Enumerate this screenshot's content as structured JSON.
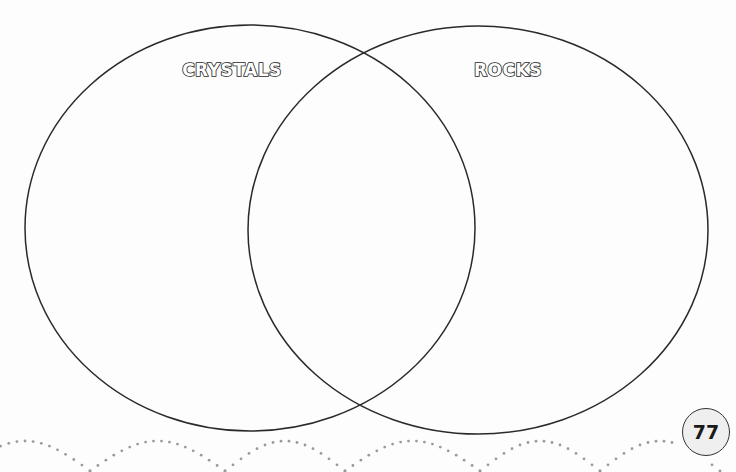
{
  "diagram": {
    "type": "venn",
    "sets": [
      {
        "label": "CRYSTALS",
        "position": "left"
      },
      {
        "label": "ROCKS",
        "position": "right"
      }
    ],
    "overlap_label": ""
  },
  "footer": {
    "page_number": "77"
  },
  "colors": {
    "outline": "#2a2a2a",
    "dots": "#9a9a9a",
    "page_badge_fill": "#efefef",
    "background": "#fdfdfd"
  }
}
